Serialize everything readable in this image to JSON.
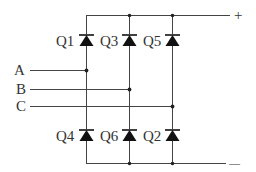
{
  "diagram": {
    "type": "three-phase bridge circuit",
    "rails": {
      "positive_label": "+",
      "negative_label": "—"
    },
    "inputs": [
      {
        "label": "A",
        "y": 70,
        "x_end": 86
      },
      {
        "label": "B",
        "y": 89,
        "x_end": 129
      },
      {
        "label": "C",
        "y": 106,
        "x_end": 172
      }
    ],
    "top_devices": [
      {
        "label": "Q1",
        "x": 86
      },
      {
        "label": "Q3",
        "x": 129
      },
      {
        "label": "Q5",
        "x": 172
      }
    ],
    "bottom_devices": [
      {
        "label": "Q4",
        "x": 86
      },
      {
        "label": "Q6",
        "x": 129
      },
      {
        "label": "Q2",
        "x": 172
      }
    ],
    "colors": {
      "line": "#444444",
      "device": "#111111",
      "text": "#333333",
      "background": "#ffffff"
    }
  }
}
